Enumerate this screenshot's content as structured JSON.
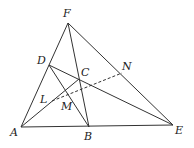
{
  "figure": {
    "type": "geometry-diagram",
    "points": {
      "F": {
        "label": "F",
        "x": 68,
        "y": 23
      },
      "D": {
        "label": "D",
        "x": 49,
        "y": 65
      },
      "C": {
        "label": "C",
        "x": 79,
        "y": 79
      },
      "N": {
        "label": "N",
        "x": 122,
        "y": 73
      },
      "L": {
        "label": "L",
        "x": 52,
        "y": 101
      },
      "M": {
        "label": "M",
        "x": 66,
        "y": 90
      },
      "A": {
        "label": "A",
        "x": 21,
        "y": 127
      },
      "B": {
        "label": "B",
        "x": 89,
        "y": 127
      },
      "E": {
        "label": "E",
        "x": 173,
        "y": 125
      }
    },
    "solid_segments": [
      [
        "A",
        "F"
      ],
      [
        "A",
        "E"
      ],
      [
        "A",
        "C"
      ],
      [
        "F",
        "B"
      ],
      [
        "F",
        "E"
      ],
      [
        "D",
        "B"
      ],
      [
        "D",
        "E"
      ]
    ],
    "dashed_segments": [
      [
        "L",
        "N"
      ]
    ],
    "stroke_color": "#333333"
  }
}
